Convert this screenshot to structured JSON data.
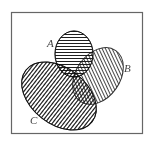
{
  "diagram": {
    "type": "venn",
    "sets": [
      {
        "id": "A",
        "label": "A",
        "hatch": "horizontal"
      },
      {
        "id": "B",
        "label": "B",
        "hatch": "diagonal"
      },
      {
        "id": "C",
        "label": "C",
        "hatch": "vertical"
      }
    ],
    "colors": {
      "stroke": "#333333",
      "frame": "#666666",
      "background": "#ffffff"
    }
  }
}
